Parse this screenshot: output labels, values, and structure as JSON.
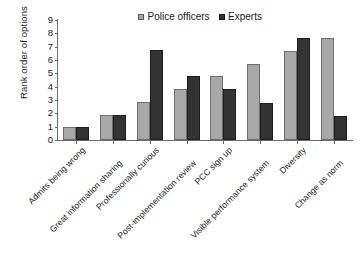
{
  "chart_data": {
    "type": "bar",
    "title": "",
    "xlabel": "",
    "ylabel": "Rank order of options",
    "ylim": [
      0,
      9
    ],
    "yticks": [
      "0",
      "1",
      "2",
      "3",
      "4",
      "5",
      "6",
      "7",
      "8",
      "9"
    ],
    "grid": false,
    "legend_position": "top-center",
    "categories": [
      "Admits being wrong",
      "Great information sharing",
      "Professionally curious",
      "Post-implementation review",
      "PCC sign up",
      "Visible performance system",
      "Diversity",
      "Change as norm"
    ],
    "series": [
      {
        "name": "Police officers",
        "color": "#a8a8a8",
        "values": [
          1.0,
          1.9,
          2.85,
          3.8,
          4.8,
          5.7,
          6.7,
          7.65
        ]
      },
      {
        "name": "Experts",
        "color": "#333333",
        "values": [
          1.0,
          1.9,
          6.75,
          4.8,
          3.8,
          2.8,
          7.65,
          1.8
        ]
      }
    ]
  }
}
